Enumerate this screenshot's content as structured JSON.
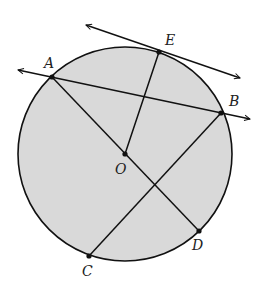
{
  "diagram": {
    "type": "circle-geometry",
    "colors": {
      "circle_fill": "#d9d9d9",
      "stroke": "#111111",
      "background": "#ffffff",
      "label": "#222222"
    },
    "circle": {
      "center_label": "O",
      "cx": 125,
      "cy": 154,
      "r": 107
    },
    "points": [
      {
        "id": "A",
        "label": "A",
        "x": 52,
        "y": 77,
        "lx": 44,
        "ly": 68
      },
      {
        "id": "B",
        "label": "B",
        "x": 221,
        "y": 113,
        "lx": 229,
        "ly": 106
      },
      {
        "id": "C",
        "label": "C",
        "x": 89,
        "y": 256,
        "lx": 82,
        "ly": 276
      },
      {
        "id": "D",
        "label": "D",
        "x": 199,
        "y": 231,
        "lx": 192,
        "ly": 250
      },
      {
        "id": "E",
        "label": "E",
        "x": 159,
        "y": 52,
        "lx": 165,
        "ly": 45
      },
      {
        "id": "O",
        "label": "O",
        "x": 125,
        "y": 154,
        "lx": 115,
        "ly": 174
      }
    ],
    "segments": [
      {
        "name": "segment-ad",
        "from": "A",
        "to": "D"
      },
      {
        "name": "segment-bc",
        "from": "B",
        "to": "C"
      },
      {
        "name": "segment-oe",
        "from": "O",
        "to": "E"
      }
    ],
    "lines": [
      {
        "name": "secant-line-ab",
        "through": [
          "A",
          "B"
        ],
        "x1": 18,
        "y1": 70,
        "x2": 250,
        "y2": 119
      },
      {
        "name": "tangent-line-at-e",
        "through": [
          "E"
        ],
        "x1": 86,
        "y1": 25,
        "x2": 240,
        "y2": 78
      }
    ]
  }
}
